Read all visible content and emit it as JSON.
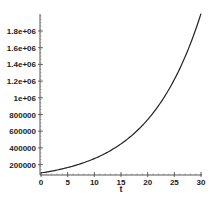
{
  "chart_data": {
    "type": "line",
    "title": "",
    "xlabel": "t",
    "ylabel": "",
    "xlim": [
      0,
      30
    ],
    "ylim": [
      100000,
      2000000
    ],
    "grid": false,
    "legend": null,
    "x_ticks": [
      0,
      5,
      10,
      15,
      20,
      25,
      30
    ],
    "x_tick_labels": [
      "0",
      "5",
      "10",
      "15",
      "20",
      "25",
      "30"
    ],
    "y_ticks": [
      200000,
      400000,
      600000,
      800000,
      1000000,
      1200000,
      1400000,
      1600000,
      1800000
    ],
    "y_tick_labels": [
      "200000",
      "400000",
      "600000",
      "800000",
      "1e+06",
      "1.2e+06",
      "1.4e+06",
      "1.6e+06",
      "1.8e+06"
    ],
    "series": [
      {
        "name": "100000*exp(0.1*t)",
        "color": "#222222",
        "x": [
          0,
          2.5,
          5,
          7.5,
          10,
          12.5,
          15,
          17.5,
          20,
          22.5,
          25,
          27.5,
          30
        ],
        "values": [
          100000,
          128403,
          164872,
          211700,
          271828,
          349034,
          448169,
          575460,
          738906,
          948774,
          1218249,
          1564263,
          2008554
        ]
      }
    ]
  }
}
